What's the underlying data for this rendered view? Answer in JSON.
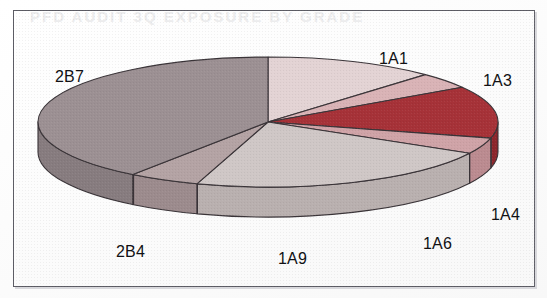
{
  "page": {
    "background_color": "#fdfdfd",
    "frame_color": "#5e5e66",
    "ghost_text": "PFD AUDIT 3Q EXPOSURE BY GRADE"
  },
  "chart_data": {
    "type": "pie",
    "title": "",
    "subtitle": "",
    "xlabel": "",
    "ylabel": "",
    "legend_position": "none",
    "labels_position": "outside",
    "three_d": true,
    "depth_px": 30,
    "center": {
      "x": 255,
      "y": 112
    },
    "radius": {
      "rx": 230,
      "ry": 65
    },
    "start_angle_deg": -90,
    "direction": "clockwise",
    "categories": [
      "1A1",
      "1A3",
      "1A4",
      "1A6",
      "1A9",
      "2B4",
      "2B7"
    ],
    "values": [
      12,
      4,
      13,
      4,
      22,
      5,
      40
    ],
    "units": "percent",
    "slices": [
      {
        "label": "1A1",
        "value": 12,
        "top_color": "#e3d3d4",
        "side_color": "#cbb9bb",
        "label_x": 366,
        "label_y": 40
      },
      {
        "label": "1A3",
        "value": 4,
        "top_color": "#d9b3b6",
        "side_color": "#c09194",
        "label_x": 470,
        "label_y": 62
      },
      {
        "label": "1A4",
        "value": 13,
        "top_color": "#a63238",
        "side_color": "#8d262c",
        "label_x": 478,
        "label_y": 196
      },
      {
        "label": "1A6",
        "value": 4,
        "top_color": "#cfa3a7",
        "side_color": "#bb8b90",
        "label_x": 410,
        "label_y": 225
      },
      {
        "label": "1A9",
        "value": 22,
        "top_color": "#cfc7c6",
        "side_color": "#b9b0af",
        "label_x": 265,
        "label_y": 240
      },
      {
        "label": "2B4",
        "value": 5,
        "top_color": "#b4a3a4",
        "side_color": "#9c8b8d",
        "label_x": 103,
        "label_y": 233
      },
      {
        "label": "2B7",
        "value": 40,
        "top_color": "#9c9093",
        "side_color": "#877c7f",
        "label_x": 42,
        "label_y": 58
      }
    ],
    "outline_color": "#3a3438"
  }
}
